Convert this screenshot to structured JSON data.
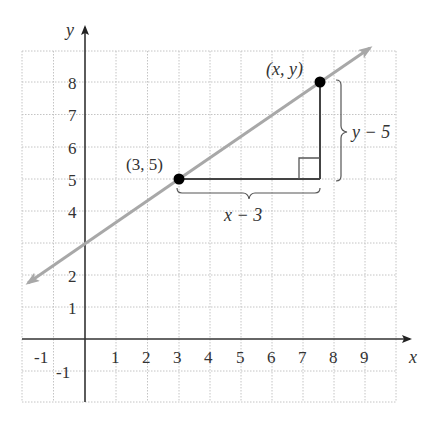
{
  "diagram": {
    "type": "coordinate-plane",
    "axes": {
      "x_label": "x",
      "y_label": "y",
      "x_ticks": [
        "-1",
        "1",
        "2",
        "3",
        "4",
        "5",
        "6",
        "7",
        "8",
        "9"
      ],
      "y_ticks": [
        "8",
        "7",
        "6",
        "5",
        "4",
        "2",
        "1",
        "-1"
      ],
      "x_range": [
        -2,
        10
      ],
      "y_range": [
        -2,
        9
      ],
      "grid": "dotted"
    },
    "line": {
      "description": "line through (3, 5) with slope 2/3, arrows at both ends",
      "color": "#a8a8a8"
    },
    "points": [
      {
        "label": "(3, 5)",
        "x": 3,
        "y": 5
      },
      {
        "label": "(x, y)",
        "x": 7.5,
        "y": 8
      }
    ],
    "annotations": {
      "horizontal_brace": "x − 3",
      "vertical_brace": "y − 5",
      "right_angle_marker": true
    },
    "colors": {
      "axis": "#333333",
      "grid": "#bbbbbb",
      "line": "#a8a8a8",
      "point": "#000000",
      "triangle": "#444444"
    }
  }
}
